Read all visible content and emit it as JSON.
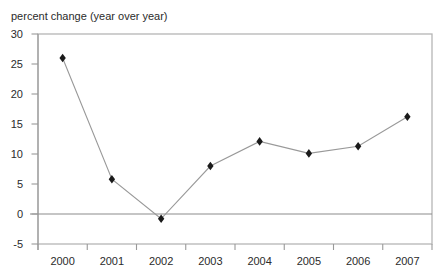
{
  "chart_data": {
    "type": "line",
    "title": "percent change (year over year)",
    "x": [
      "2000",
      "2001",
      "2002",
      "2003",
      "2004",
      "2005",
      "2006",
      "2007"
    ],
    "values": [
      26.0,
      5.8,
      -0.8,
      8.0,
      12.1,
      10.1,
      11.3,
      16.2
    ],
    "xlabel": "",
    "ylabel": "",
    "ylim": [
      -5,
      30
    ],
    "yticks": [
      30,
      25,
      20,
      15,
      10,
      5,
      0,
      -5
    ],
    "grid": false,
    "legend": "none",
    "marker": "diamond",
    "zero_line": true,
    "colors": {
      "line": "#999999",
      "marker": "#1a1a1a",
      "frame": "#b5b5b5",
      "axis": "#999999",
      "zero_line": "#8c8c8c",
      "text": "#2b2b2b",
      "background": "#ffffff"
    }
  }
}
